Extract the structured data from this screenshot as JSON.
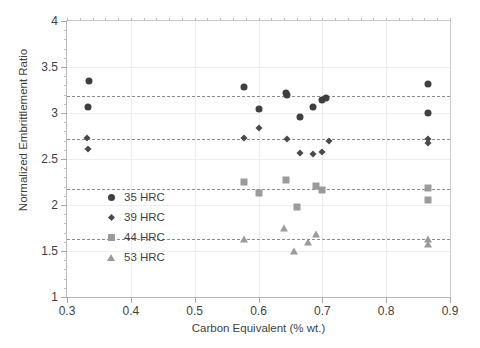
{
  "chart_data": {
    "type": "scatter",
    "title": "",
    "xlabel": "Carbon Equivalent (% wt.)",
    "ylabel": "Normalized Embrittlement Ratio",
    "xlim": [
      0.3,
      0.9
    ],
    "ylim": [
      1,
      4
    ],
    "xticks": [
      "0.3",
      "0.4",
      "0.5",
      "0.6",
      "0.7",
      "0.8",
      "0.9"
    ],
    "xtick_values": [
      0.3,
      0.4,
      0.5,
      0.6,
      0.7,
      0.8,
      0.9
    ],
    "yticks": [
      "1",
      "1.5",
      "2",
      "2.5",
      "3",
      "3.5",
      "4"
    ],
    "ytick_values": [
      1,
      1.5,
      2,
      2.5,
      3,
      3.5,
      4
    ],
    "xminor_step": 0.02,
    "yminor_step": 0.1,
    "grid": "light horizontal and vertical at major ticks",
    "legend_position": "inside lower-left",
    "series": [
      {
        "name": "35 HRC",
        "marker": "circle",
        "color": "#3f3f3f",
        "points": [
          [
            0.335,
            3.35
          ],
          [
            0.333,
            3.07
          ],
          [
            0.578,
            3.28
          ],
          [
            0.6,
            3.04
          ],
          [
            0.643,
            3.22
          ],
          [
            0.645,
            3.2
          ],
          [
            0.665,
            2.96
          ],
          [
            0.685,
            3.06
          ],
          [
            0.7,
            3.14
          ],
          [
            0.706,
            3.16
          ],
          [
            0.865,
            3.31
          ],
          [
            0.865,
            3.0
          ]
        ]
      },
      {
        "name": "39 HRC",
        "marker": "diamond",
        "color": "#4a4a4a",
        "points": [
          [
            0.332,
            2.73
          ],
          [
            0.333,
            2.61
          ],
          [
            0.578,
            2.73
          ],
          [
            0.6,
            2.84
          ],
          [
            0.645,
            2.72
          ],
          [
            0.665,
            2.56
          ],
          [
            0.685,
            2.55
          ],
          [
            0.7,
            2.58
          ],
          [
            0.71,
            2.7
          ],
          [
            0.865,
            2.72
          ],
          [
            0.865,
            2.67
          ]
        ]
      },
      {
        "name": "44 HRC",
        "marker": "square",
        "color": "#9b9b9b",
        "points": [
          [
            0.578,
            2.25
          ],
          [
            0.6,
            2.13
          ],
          [
            0.643,
            2.27
          ],
          [
            0.66,
            1.98
          ],
          [
            0.69,
            2.21
          ],
          [
            0.7,
            2.16
          ],
          [
            0.865,
            2.18
          ],
          [
            0.865,
            2.05
          ]
        ]
      },
      {
        "name": "53 HRC",
        "marker": "triangle",
        "color": "#9b9b9b",
        "points": [
          [
            0.578,
            1.63
          ],
          [
            0.64,
            1.75
          ],
          [
            0.655,
            1.5
          ],
          [
            0.678,
            1.6
          ],
          [
            0.69,
            1.68
          ],
          [
            0.865,
            1.63
          ],
          [
            0.865,
            1.58
          ]
        ]
      }
    ],
    "reference_lines": [
      {
        "series": "35 HRC",
        "y": 3.18,
        "style": "dashed"
      },
      {
        "series": "39 HRC",
        "y": 2.72,
        "style": "dashed"
      },
      {
        "series": "44 HRC",
        "y": 2.17,
        "style": "dashed"
      },
      {
        "series": "53 HRC",
        "y": 1.63,
        "style": "dashed"
      }
    ]
  },
  "legend": {
    "items": [
      {
        "label": "35 HRC",
        "marker": "circle"
      },
      {
        "label": "39 HRC",
        "marker": "diamond"
      },
      {
        "label": "44 HRC",
        "marker": "square"
      },
      {
        "label": "53 HRC",
        "marker": "triangle"
      }
    ]
  }
}
